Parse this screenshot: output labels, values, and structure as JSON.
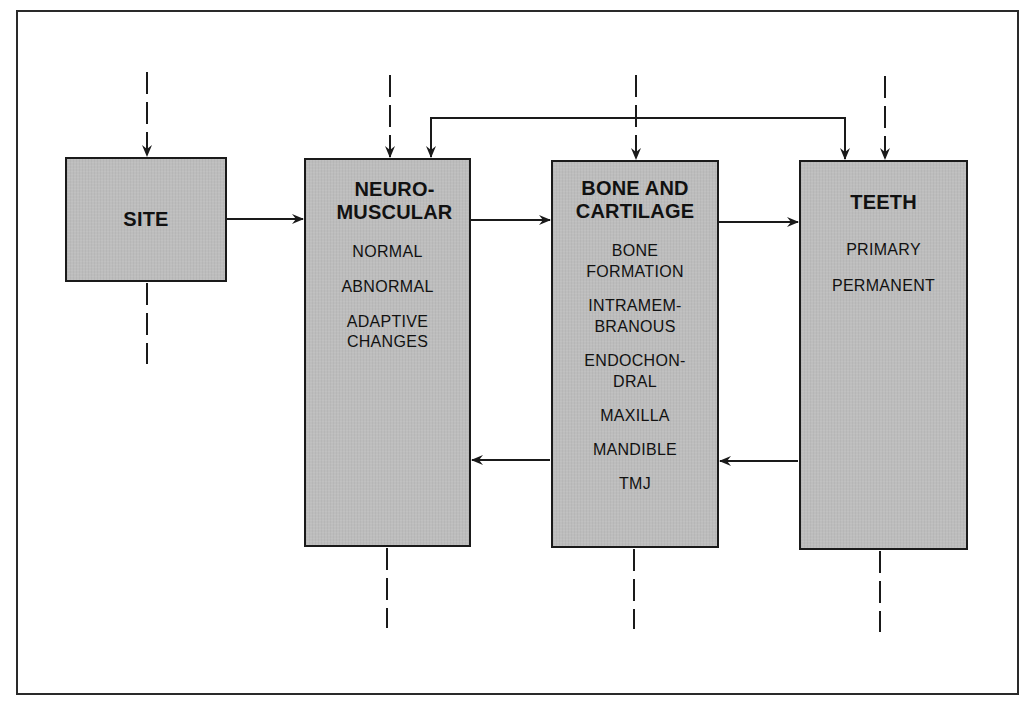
{
  "diagram": {
    "type": "flow-diagram",
    "colors": {
      "box_fill": "#bdbdbd",
      "box_border": "#1a1a1a",
      "line": "#1a1a1a",
      "background": "#ffffff"
    },
    "boxes": {
      "site": {
        "title": [
          "SITE"
        ],
        "items": []
      },
      "neuromuscular": {
        "title": [
          "NEURO-",
          "MUSCULAR"
        ],
        "items": [
          [
            "NORMAL"
          ],
          [
            "ABNORMAL"
          ],
          [
            "ADAPTIVE",
            "CHANGES"
          ]
        ]
      },
      "bone_cartilage": {
        "title": [
          "BONE AND",
          "CARTILAGE"
        ],
        "items": [
          [
            "BONE",
            "FORMATION"
          ],
          [
            "INTRAMEM-",
            "BRANOUS"
          ],
          [
            "ENDOCHON-",
            "DRAL"
          ],
          [
            "MAXILLA"
          ],
          [
            "MANDIBLE"
          ],
          [
            "TMJ"
          ]
        ]
      },
      "teeth": {
        "title": [
          "TEETH"
        ],
        "items": [
          [
            "PRIMARY",
            "PERMANENT"
          ]
        ]
      }
    },
    "connections": [
      {
        "from": "site",
        "to": "neuromuscular",
        "style": "solid",
        "direction": "right"
      },
      {
        "from": "neuromuscular",
        "to": "bone_cartilage",
        "style": "solid",
        "direction": "right"
      },
      {
        "from": "bone_cartilage",
        "to": "teeth",
        "style": "solid",
        "direction": "right"
      },
      {
        "from": "teeth",
        "to": "bone_cartilage",
        "style": "solid",
        "direction": "left"
      },
      {
        "from": "bone_cartilage",
        "to": "neuromuscular",
        "style": "solid",
        "direction": "left"
      },
      {
        "from": "neuromuscular",
        "to": "teeth",
        "style": "solid",
        "direction": "bidirectional-overhead"
      },
      {
        "from": "external",
        "to": "site",
        "style": "dashed",
        "direction": "down"
      },
      {
        "from": "external",
        "to": "neuromuscular",
        "style": "dashed",
        "direction": "down"
      },
      {
        "from": "external",
        "to": "bone_cartilage",
        "style": "dashed",
        "direction": "down"
      },
      {
        "from": "external",
        "to": "teeth",
        "style": "dashed",
        "direction": "down"
      },
      {
        "from": "site",
        "to": "external",
        "style": "dashed",
        "direction": "down-out"
      },
      {
        "from": "neuromuscular",
        "to": "external",
        "style": "dashed",
        "direction": "down-out"
      },
      {
        "from": "bone_cartilage",
        "to": "external",
        "style": "dashed",
        "direction": "down-out"
      },
      {
        "from": "teeth",
        "to": "external",
        "style": "dashed",
        "direction": "down-out"
      }
    ]
  }
}
